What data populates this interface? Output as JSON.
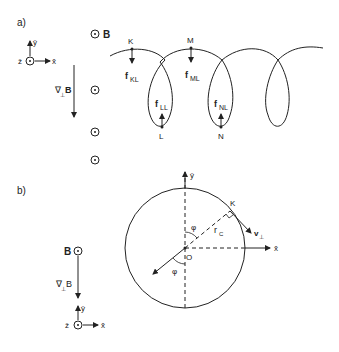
{
  "panel_a": {
    "label": "a)",
    "axes": {
      "y": "ŷ",
      "z": "ẑ",
      "x": "x̂"
    },
    "field_label": "B",
    "gradient_label": "∇",
    "gradient_sub": "⊥",
    "gradient_B": "B",
    "points": {
      "K": "K",
      "M": "M",
      "L": "L",
      "N": "N"
    },
    "forces": {
      "KL": {
        "f": "f",
        "sub": "KL"
      },
      "ML": {
        "f": "f",
        "sub": "ML"
      },
      "LL": {
        "f": "f",
        "sub": "LL"
      },
      "NL": {
        "f": "f",
        "sub": "NL"
      }
    }
  },
  "panel_b": {
    "label": "b)",
    "axes": {
      "y": "ŷ",
      "x": "x̂",
      "z": "ẑ"
    },
    "field_label": "B",
    "gradient_label": "∇",
    "gradient_sub": "⊥",
    "gradient_B": "B",
    "point_K": "K",
    "origin": "O",
    "angle": "φ",
    "radius": "r",
    "radius_sub": "C",
    "velocity": "v",
    "velocity_sub": "⊥"
  },
  "colors": {
    "ink": "#222222",
    "background": "#ffffff"
  }
}
